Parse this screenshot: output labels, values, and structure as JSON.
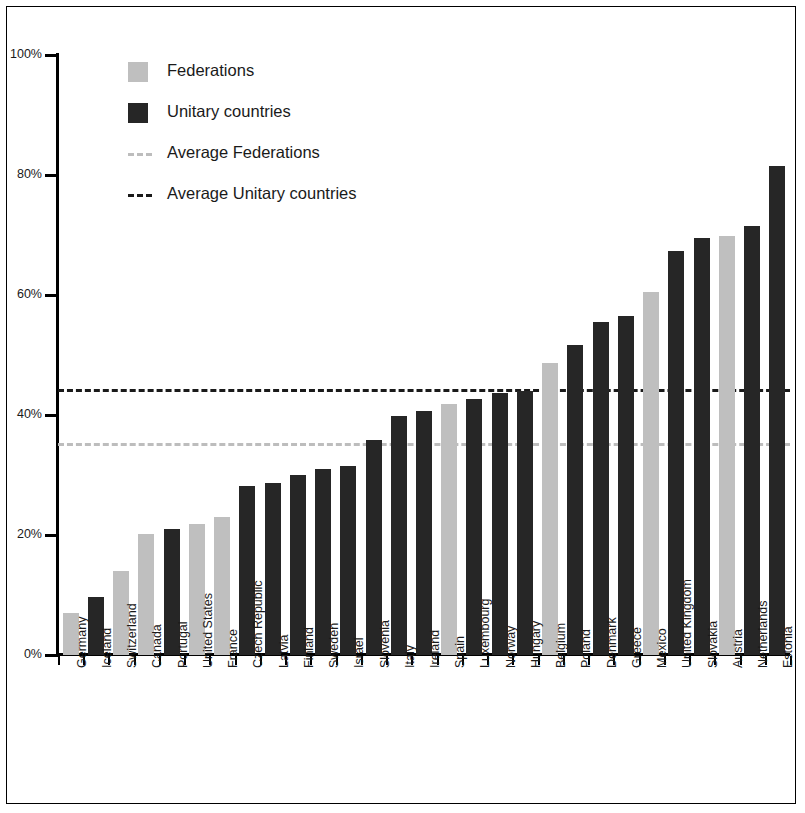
{
  "chart_data": {
    "type": "bar",
    "title": "",
    "subtitle": "",
    "xlabel": "",
    "ylabel": "",
    "ylim": [
      0,
      100
    ],
    "yticks": [
      0,
      20,
      40,
      60,
      80,
      100
    ],
    "ytick_labels": [
      "0%",
      "20%",
      "40%",
      "60%",
      "80%",
      "100%"
    ],
    "grid": false,
    "legend_position": "top-left",
    "legend": [
      {
        "key": "federations",
        "label": "Federations",
        "marker": "square",
        "color": "#bfbfbf"
      },
      {
        "key": "unitary",
        "label": "Unitary countries",
        "marker": "square",
        "color": "#262626"
      },
      {
        "key": "avg_federations",
        "label": "Average Federations",
        "marker": "dashed-line",
        "color": "#bdbdbd"
      },
      {
        "key": "avg_unitary",
        "label": "Average Unitary countries",
        "marker": "dashed-line",
        "color": "#1a1a1a"
      }
    ],
    "categories": [
      "Germany",
      "Iceland",
      "Switzerland",
      "Canada",
      "Portugal",
      "United States",
      "France",
      "Czech Republic",
      "Latvia",
      "Finland",
      "Sweden",
      "Israel",
      "Slovenia",
      "Italy",
      "Ireland",
      "Spain",
      "Luxembourg",
      "Norway",
      "Hungary",
      "Belgium",
      "Poland",
      "Denmark",
      "Greece",
      "Mexico",
      "United Kingdom",
      "Slovakia",
      "Austria",
      "Netherlands",
      "Estonia"
    ],
    "values": [
      7.0,
      9.7,
      14.0,
      20.2,
      21.0,
      21.8,
      23.0,
      28.2,
      28.6,
      30.0,
      31.0,
      31.5,
      35.8,
      39.8,
      40.7,
      41.8,
      42.7,
      43.7,
      44.0,
      48.7,
      51.7,
      55.5,
      56.5,
      60.5,
      67.3,
      69.5,
      69.9,
      71.5,
      81.5
    ],
    "groups": [
      "federations",
      "unitary",
      "federations",
      "federations",
      "unitary",
      "federations",
      "federations",
      "unitary",
      "unitary",
      "unitary",
      "unitary",
      "unitary",
      "unitary",
      "unitary",
      "unitary",
      "federations",
      "unitary",
      "unitary",
      "unitary",
      "federations",
      "unitary",
      "unitary",
      "unitary",
      "federations",
      "unitary",
      "unitary",
      "federations",
      "unitary",
      "unitary"
    ],
    "reference_lines": [
      {
        "key": "avg_unitary",
        "label": "Average Unitary countries",
        "value": 44.3,
        "color": "#1a1a1a",
        "style": "dashed"
      },
      {
        "key": "avg_federations",
        "label": "Average Federations",
        "value": 35.4,
        "color": "#bdbdbd",
        "style": "dashed"
      }
    ],
    "colors": {
      "federations": "#bfbfbf",
      "unitary": "#262626",
      "axis": "#000000",
      "background": "#ffffff"
    }
  }
}
